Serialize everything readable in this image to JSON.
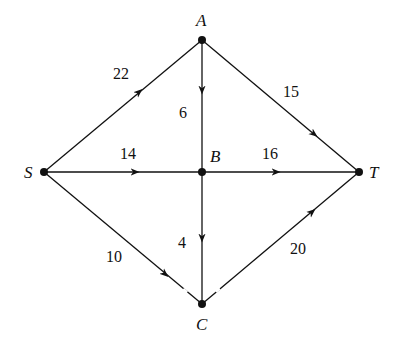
{
  "title_fragment": "g",
  "nodes": {
    "A": {
      "label": "A",
      "x": 202,
      "y": 40
    },
    "B": {
      "label": "B",
      "x": 202,
      "y": 172
    },
    "C": {
      "label": "C",
      "x": 202,
      "y": 304
    },
    "S": {
      "label": "S",
      "x": 44,
      "y": 172
    },
    "T": {
      "label": "T",
      "x": 359,
      "y": 172
    }
  },
  "edges": [
    {
      "from": "S",
      "to": "A",
      "weight": "22"
    },
    {
      "from": "A",
      "to": "T",
      "weight": "15"
    },
    {
      "from": "A",
      "to": "B",
      "weight": "6"
    },
    {
      "from": "S",
      "to": "B",
      "weight": "14"
    },
    {
      "from": "B",
      "to": "T",
      "weight": "16"
    },
    {
      "from": "B",
      "to": "C",
      "weight": "4"
    },
    {
      "from": "S",
      "to": "C",
      "weight": "10"
    },
    {
      "from": "C",
      "to": "T",
      "weight": "20"
    }
  ]
}
